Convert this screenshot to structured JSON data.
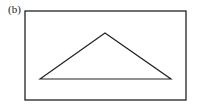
{
  "figure": {
    "label": "(b)",
    "frame": {
      "x": 25,
      "y": 11,
      "width": 161,
      "height": 89,
      "stroke": "#222222"
    },
    "triangle": {
      "points": [
        [
          40,
          79
        ],
        [
          105,
          33
        ],
        [
          171,
          79
        ]
      ],
      "stroke": "#222222"
    }
  }
}
